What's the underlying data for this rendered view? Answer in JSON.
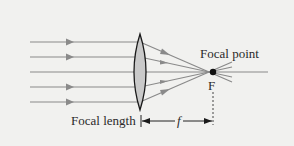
{
  "diagram": {
    "type": "converging-lens-ray-diagram",
    "labels": {
      "focal_point": "Focal point",
      "focal_point_symbol": "F",
      "focal_length": "Focal length",
      "focal_length_symbol": "f"
    },
    "rays": [
      {
        "y": 42,
        "arrow": true
      },
      {
        "y": 57,
        "arrow": true
      },
      {
        "y": 72,
        "arrow": false
      },
      {
        "y": 87,
        "arrow": true
      },
      {
        "y": 102,
        "arrow": true
      }
    ],
    "lens": {
      "center_x": 140,
      "top_y": 34,
      "bottom_y": 110,
      "fill": "#c9c9c9"
    },
    "focal_point": {
      "x": 213,
      "y": 72
    },
    "colors": {
      "ray": "#8a8a8a",
      "lens_outline": "#1a1a1a",
      "lens_fill": "#c9c9c9",
      "text": "#2a2a2a",
      "background": "#f1f1ef"
    }
  }
}
